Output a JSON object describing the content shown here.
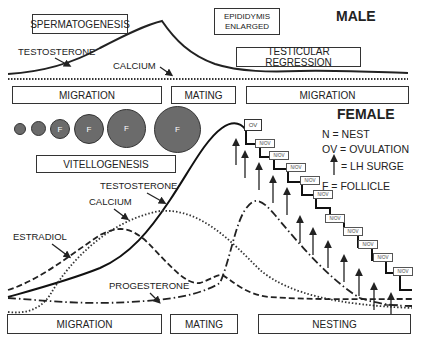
{
  "male": {
    "title": "MALE",
    "boxes": {
      "spermatogenesis": "SPERMATOGENESIS",
      "epididymis_line1": "EPIDIDYMIS",
      "epididymis_line2": "ENLARGED",
      "testicular_regression": "TESTICULAR REGRESSION"
    },
    "curve_labels": {
      "testosterone": "TESTOSTERONE",
      "calcium": "CALCIUM"
    },
    "phases": [
      "MIGRATION",
      "MATING",
      "MIGRATION"
    ]
  },
  "female": {
    "title": "FEMALE",
    "follicle_label": "F",
    "follicles": [
      {
        "size": 12,
        "label": ""
      },
      {
        "size": 15,
        "label": ""
      },
      {
        "size": 20,
        "label": "F"
      },
      {
        "size": 30,
        "label": "F"
      },
      {
        "size": 38,
        "label": "F"
      },
      {
        "size": 46,
        "label": "F"
      }
    ],
    "vitellogenesis": "VITELLOGENESIS",
    "curve_labels": {
      "testosterone": "TESTOSTERONE",
      "calcium": "CALCIUM",
      "estradiol": "ESTRADIOL",
      "progesterone": "PROGESTERONE"
    },
    "ov_label": "OV",
    "nov_labels": [
      "N/OV",
      "N/OV",
      "N/OV",
      "N/OV",
      "N/OV",
      "N/OV",
      "N/OV",
      "N/OV",
      "N/OV",
      "N/OV"
    ],
    "phases": [
      "MIGRATION",
      "MATING",
      "NESTING"
    ]
  },
  "legend": {
    "nest": "N = NEST",
    "ovulation": "OV = OVULATION",
    "lh_surge": "= LH SURGE",
    "follicle": "F = FOLLICLE"
  }
}
